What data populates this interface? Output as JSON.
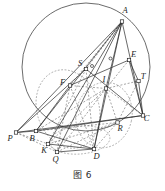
{
  "figure": {
    "caption": "图 6",
    "type": "euclidean-geometry-diagram",
    "width": 165,
    "height": 191,
    "stroke_color": "#2a2a2a",
    "dashed_color": "#6a6a6a",
    "background": "#ffffff",
    "points": [
      {
        "id": "A",
        "label": "A",
        "x": 122,
        "y": 21.5,
        "lx": 125,
        "ly": 12.5
      },
      {
        "id": "E",
        "label": "E",
        "x": 129,
        "y": 60,
        "lx": 133.5,
        "ly": 57
      },
      {
        "id": "T",
        "label": "T",
        "x": 138.5,
        "y": 81,
        "lx": 143,
        "ly": 79
      },
      {
        "id": "C",
        "label": "C",
        "x": 143,
        "y": 115.5,
        "lx": 146.5,
        "ly": 121
      },
      {
        "id": "R",
        "label": "R",
        "x": 117.5,
        "y": 122.5,
        "lx": 120,
        "ly": 131
      },
      {
        "id": "D",
        "label": "D",
        "x": 94,
        "y": 149,
        "lx": 96.5,
        "ly": 159
      },
      {
        "id": "Q",
        "label": "Q",
        "x": 57,
        "y": 152,
        "lx": 55.5,
        "ly": 162
      },
      {
        "id": "K",
        "label": "K",
        "x": 48,
        "y": 144,
        "lx": 44,
        "ly": 153
      },
      {
        "id": "B",
        "label": "B",
        "x": 36,
        "y": 131,
        "lx": 32,
        "ly": 141
      },
      {
        "id": "P",
        "label": "P",
        "x": 16,
        "y": 132.5,
        "lx": 10,
        "ly": 141
      },
      {
        "id": "F",
        "label": "F",
        "x": 70,
        "y": 85.5,
        "lx": 62.5,
        "ly": 85
      },
      {
        "id": "S",
        "label": "S",
        "x": 86,
        "y": 69,
        "lx": 80,
        "ly": 65.5
      },
      {
        "id": "I",
        "label": "I",
        "x": 106,
        "y": 88.5,
        "lx": 104,
        "ly": 82
      },
      {
        "id": "M",
        "label": "",
        "x": 110.5,
        "y": 58.5,
        "lx": 0,
        "ly": 0
      },
      {
        "id": "N",
        "label": "",
        "x": 92,
        "y": 66,
        "lx": 0,
        "ly": 0
      }
    ],
    "circumcircle": {
      "cx": 86,
      "cy": 67,
      "r": 64
    },
    "dashed_circles": [
      {
        "id": "left-dashed-circle",
        "cx": 68,
        "cy": 109,
        "rx": 31,
        "ry": 40,
        "rot": -18
      },
      {
        "id": "right-dashed-circle",
        "cx": 104,
        "cy": 115,
        "rx": 28,
        "ry": 33,
        "rot": 12
      },
      {
        "id": "lower-dashed-arc",
        "cx": 80,
        "cy": 140,
        "rx": 30,
        "ry": 14,
        "rot": -5
      }
    ],
    "segments": [
      {
        "from": "A",
        "to": "B",
        "style": "solid"
      },
      {
        "from": "A",
        "to": "C",
        "style": "solid"
      },
      {
        "from": "A",
        "to": "D",
        "style": "solid"
      },
      {
        "from": "A",
        "to": "K",
        "style": "solid"
      },
      {
        "from": "A",
        "to": "Q",
        "style": "solid"
      },
      {
        "from": "A",
        "to": "I",
        "style": "solid"
      },
      {
        "from": "B",
        "to": "C",
        "style": "solid"
      },
      {
        "from": "B",
        "to": "D",
        "style": "solid"
      },
      {
        "from": "P",
        "to": "C",
        "style": "solid"
      },
      {
        "from": "P",
        "to": "S",
        "style": "solid"
      },
      {
        "from": "P",
        "to": "A",
        "style": "solid"
      },
      {
        "from": "P",
        "to": "B",
        "style": "solid"
      },
      {
        "from": "K",
        "to": "D",
        "style": "solid"
      },
      {
        "from": "Q",
        "to": "D",
        "style": "solid"
      },
      {
        "from": "F",
        "to": "E",
        "style": "solid"
      },
      {
        "from": "E",
        "to": "C",
        "style": "solid"
      },
      {
        "from": "E",
        "to": "T",
        "style": "solid"
      },
      {
        "from": "T",
        "to": "C",
        "style": "solid"
      },
      {
        "from": "S",
        "to": "C",
        "style": "solid"
      },
      {
        "from": "F",
        "to": "B",
        "style": "solid"
      },
      {
        "from": "I",
        "to": "D",
        "style": "solid"
      },
      {
        "from": "A",
        "to": "F",
        "style": "dashed"
      },
      {
        "from": "A",
        "to": "S",
        "style": "dashed"
      },
      {
        "from": "B",
        "to": "I",
        "style": "dashed"
      },
      {
        "from": "C",
        "to": "I",
        "style": "dashed"
      },
      {
        "from": "I",
        "to": "F",
        "style": "dashed"
      },
      {
        "from": "I",
        "to": "T",
        "style": "dashed"
      },
      {
        "from": "I",
        "to": "R",
        "style": "dashed"
      },
      {
        "from": "I",
        "to": "K",
        "style": "dashed"
      },
      {
        "from": "I",
        "to": "Q",
        "style": "dashed"
      },
      {
        "from": "K",
        "to": "R",
        "style": "dashed"
      },
      {
        "from": "Q",
        "to": "R",
        "style": "dashed"
      },
      {
        "from": "B",
        "to": "R",
        "style": "dashed"
      },
      {
        "from": "F",
        "to": "D",
        "style": "dashed"
      },
      {
        "from": "S",
        "to": "K",
        "style": "dashed"
      },
      {
        "from": "S",
        "to": "D",
        "style": "dashed"
      },
      {
        "from": "F",
        "to": "Q",
        "style": "dashed"
      },
      {
        "from": "E",
        "to": "I",
        "style": "dashed"
      },
      {
        "from": "T",
        "to": "R",
        "style": "dashed"
      },
      {
        "from": "P",
        "to": "K",
        "style": "dashed"
      },
      {
        "from": "P",
        "to": "Q",
        "style": "dashed"
      },
      {
        "from": "D",
        "to": "R",
        "style": "dashed"
      },
      {
        "from": "K",
        "to": "Q",
        "style": "dashed"
      }
    ]
  }
}
